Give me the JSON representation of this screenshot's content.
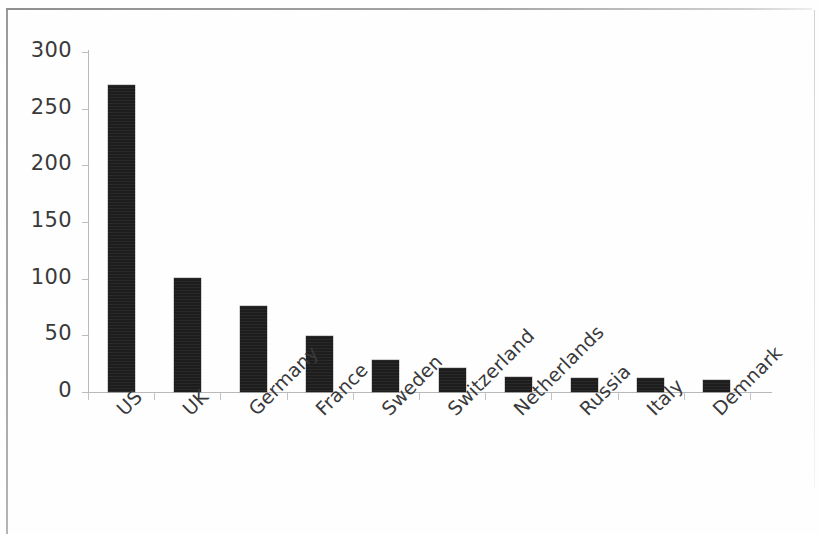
{
  "chart_data": {
    "type": "bar",
    "title": "",
    "subtitle": "",
    "xlabel": "",
    "ylabel": "",
    "categories": [
      "US",
      "UK",
      "Germany",
      "France",
      "Sweden",
      "Switzerland",
      "Netherlands",
      "Russia",
      "Italy",
      "Demnark"
    ],
    "values": [
      271,
      101,
      76,
      49,
      28,
      21,
      13,
      12,
      12,
      11
    ],
    "series": [
      {
        "name": "",
        "values": [
          271,
          101,
          76,
          49,
          28,
          21,
          13,
          12,
          12,
          11
        ]
      }
    ],
    "ylim": [
      0,
      300
    ],
    "y_ticks": [
      0,
      50,
      100,
      150,
      200,
      250,
      300
    ],
    "y_tick_labels": [
      "0",
      "50",
      "100",
      "150",
      "200",
      "250",
      "300"
    ],
    "grid": false,
    "legend": false,
    "legend_position": "none",
    "annotations": [],
    "bar_color": "#1d1d1d",
    "axis_color": "#b9b9b9",
    "text_color": "#39393b",
    "background_color": "#fefefe"
  }
}
